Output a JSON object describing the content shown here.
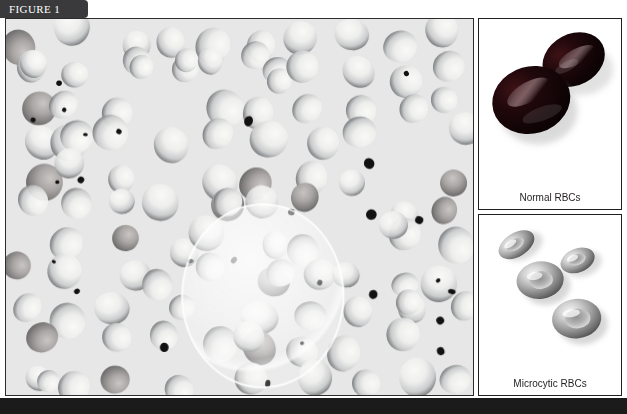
{
  "figure": {
    "tab_label": "FIGURE 1",
    "tab_color": "#3a3a3c",
    "bottom_bar_color": "#1b1b1b"
  },
  "main_panel": {
    "name": "peripheral-blood-smear",
    "background_color": "#e7e7e6",
    "border_color": "#2c2c2c",
    "cell_rim_color": "#6f7173",
    "cell_fill_color": "#f0f0ef",
    "platelet_color": "#111111",
    "highlight": {
      "label": "magnified-field-highlight",
      "cx_pct": 55,
      "cy_pct": 74,
      "radius_pct": 20,
      "color": "#ffffff"
    }
  },
  "side_panels": [
    {
      "id": "normal-rbcs",
      "caption": "Normal RBCs",
      "cell_color": "#140608",
      "cell_highlight_color": "#6e5055",
      "cell_count": 2,
      "background_color": "#ffffff"
    },
    {
      "id": "microcytic-rbcs",
      "caption": "Microcytic RBCs",
      "cell_color": "#9a9a9a",
      "cell_highlight_color": "#f2f2f2",
      "cell_count": 4,
      "background_color": "#ffffff"
    }
  ]
}
